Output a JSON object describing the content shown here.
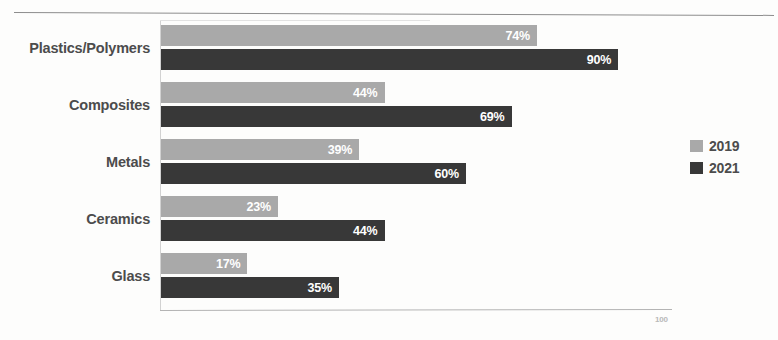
{
  "chart": {
    "type": "bar",
    "orientation": "horizontal",
    "axis_max_label": "100"
  },
  "legend": {
    "position": "right",
    "entries": [
      {
        "name": "2019",
        "color": "#a9a9a9"
      },
      {
        "name": "2021",
        "color": "#383838"
      }
    ]
  },
  "chart_data": {
    "type": "bar",
    "title": "",
    "subtitle": "",
    "xlabel": "",
    "ylabel": "",
    "orientation": "horizontal",
    "grid": false,
    "legend_position": "right",
    "xlim": [
      0,
      100
    ],
    "value_suffix": "%",
    "categories": [
      "Plastics/Polymers",
      "Composites",
      "Metals",
      "Ceramics",
      "Glass"
    ],
    "series": [
      {
        "name": "2019",
        "color": "#a9a9a9",
        "values": [
          74,
          44,
          39,
          23,
          17
        ],
        "labels": [
          "74%",
          "44%",
          "39%",
          "23%",
          "17%"
        ]
      },
      {
        "name": "2021",
        "color": "#383838",
        "values": [
          90,
          69,
          60,
          44,
          35
        ],
        "labels": [
          "90%",
          "69%",
          "60%",
          "44%",
          "35%"
        ]
      }
    ],
    "tick_labels": [
      "100"
    ]
  }
}
